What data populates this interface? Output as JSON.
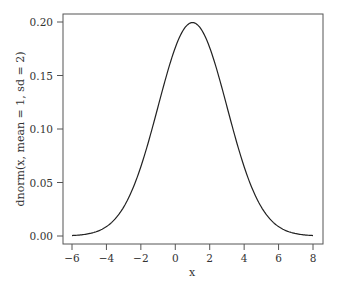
{
  "chart_data": {
    "type": "line",
    "title": "",
    "xlabel": "x",
    "ylabel": "dnorm(x, mean = 1, sd = 2)",
    "xlim": [
      -6,
      8
    ],
    "ylim": [
      0,
      0.2
    ],
    "xticks": [
      "-6",
      "-4",
      "-2",
      "0",
      "2",
      "4",
      "6",
      "8"
    ],
    "yticks": [
      "0.00",
      "0.05",
      "0.10",
      "0.15",
      "0.20"
    ],
    "grid": false,
    "legend": null,
    "series": [
      {
        "name": "dnorm(x, mean = 1, sd = 2)",
        "mean": 1,
        "sd": 2,
        "x": [
          -6,
          -5,
          -4,
          -3,
          -2,
          -1,
          0,
          1,
          2,
          3,
          4,
          5,
          6,
          7,
          8
        ],
        "y": [
          0.0004,
          0.0022,
          0.0088,
          0.027,
          0.0648,
          0.121,
          0.176,
          0.1995,
          0.176,
          0.121,
          0.0648,
          0.027,
          0.0088,
          0.0022,
          0.0004
        ]
      }
    ],
    "line_color": "#222222"
  }
}
